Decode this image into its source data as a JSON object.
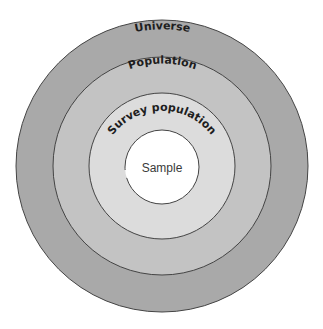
{
  "diagram": {
    "type": "concentric-circles",
    "colors": {
      "universe": "#a9a9a9",
      "population": "#c3c3c3",
      "survey_population": "#dcdcdc",
      "sample": "#ffffff",
      "stroke": "#444444",
      "background": "#ffffff"
    },
    "rings": [
      {
        "id": "universe",
        "label": "Universe"
      },
      {
        "id": "population",
        "label": "Population"
      },
      {
        "id": "survey_population",
        "label": "Survey population"
      },
      {
        "id": "sample",
        "label": "Sample"
      }
    ]
  }
}
